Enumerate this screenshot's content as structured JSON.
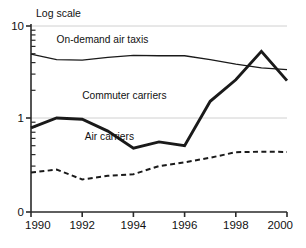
{
  "chart_data": {
    "type": "line",
    "title": "",
    "scale_note": "Log scale",
    "xlabel": "",
    "ylabel": "",
    "yscale": "log",
    "grid": true,
    "grid_lines": [
      10,
      1
    ],
    "legend": "inline-labels",
    "xlim": [
      1990,
      2000
    ],
    "ylim": [
      0.2,
      10
    ],
    "x": [
      1990,
      1991,
      1992,
      1993,
      1994,
      1995,
      1996,
      1997,
      1998,
      1999,
      2000
    ],
    "xticks": [
      "1990",
      "1992",
      "1994",
      "1996",
      "1998",
      "2000"
    ],
    "xtick_values": [
      1990,
      1992,
      1994,
      1996,
      1998,
      2000
    ],
    "yticks": [
      "10",
      "1",
      "0"
    ],
    "ytick_values": [
      10,
      1,
      0
    ],
    "minor_ticks": [
      9,
      8,
      7,
      6,
      5,
      4,
      3,
      2,
      0.9,
      0.8,
      0.7,
      0.6,
      0.5,
      0.4,
      0.3
    ],
    "series": [
      {
        "name": "On-demand air taxis",
        "style": "solid-thin",
        "color": "#1a1a1a",
        "label_x": 1991.0,
        "label_y": 6.6,
        "values": [
          4.95,
          4.3,
          4.25,
          4.55,
          4.8,
          4.75,
          4.75,
          4.3,
          3.85,
          3.5,
          3.35
        ]
      },
      {
        "name": "Commuter carriers",
        "style": "solid-thick",
        "color": "#1a1a1a",
        "label_x": 1992.0,
        "label_y": 1.62,
        "values": [
          0.78,
          1.0,
          0.97,
          0.72,
          0.47,
          0.55,
          0.5,
          1.52,
          2.6,
          5.3,
          2.55
        ]
      },
      {
        "name": "Air carriers",
        "style": "dashed",
        "color": "#1a1a1a",
        "label_x": 1992.1,
        "label_y": 0.57,
        "values": [
          0.255,
          0.275,
          0.215,
          0.235,
          0.245,
          0.3,
          0.33,
          0.37,
          0.425,
          0.43,
          0.428
        ]
      }
    ]
  },
  "colors": {
    "ink": "#1a1a1a",
    "axis": "#2a2a2a",
    "grid": "#d0d0d0",
    "background": "#ffffff"
  }
}
